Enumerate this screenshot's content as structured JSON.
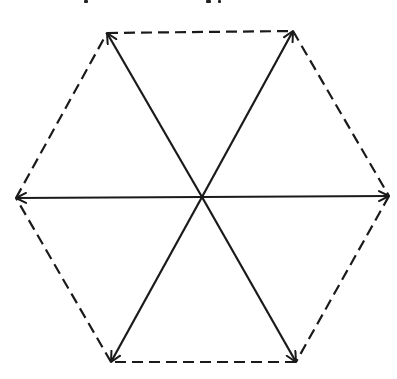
{
  "diagram": {
    "type": "hexagon-vector-diagram",
    "center": [
      202,
      197
    ],
    "stroke_color": "#1a1a1a",
    "background_color": "#ffffff",
    "vertices": [
      {
        "name": "top-left",
        "x": 107,
        "y": 33
      },
      {
        "name": "top-right",
        "x": 293,
        "y": 31
      },
      {
        "name": "right",
        "x": 389,
        "y": 196
      },
      {
        "name": "bottom-right",
        "x": 296,
        "y": 362
      },
      {
        "name": "bottom-left",
        "x": 111,
        "y": 362
      },
      {
        "name": "left",
        "x": 16,
        "y": 198
      }
    ],
    "edges_style": "dashed",
    "arrows_style": "solid-with-arrowhead",
    "arrow_count": 6
  }
}
